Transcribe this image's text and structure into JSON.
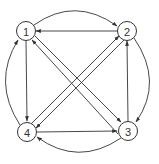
{
  "diagram": {
    "type": "directed-graph",
    "nodes": [
      {
        "id": "1",
        "label": "1",
        "x": 26,
        "y": 31
      },
      {
        "id": "2",
        "label": "2",
        "x": 127,
        "y": 31
      },
      {
        "id": "3",
        "label": "3",
        "x": 128,
        "y": 131
      },
      {
        "id": "4",
        "label": "4",
        "x": 27,
        "y": 132
      }
    ],
    "edges": [
      {
        "from": "1",
        "to": "2",
        "style": "arc-outer"
      },
      {
        "from": "2",
        "to": "3",
        "style": "arc-outer"
      },
      {
        "from": "3",
        "to": "4",
        "style": "arc-outer"
      },
      {
        "from": "4",
        "to": "1",
        "style": "arc-outer"
      },
      {
        "from": "2",
        "to": "1",
        "style": "straight"
      },
      {
        "from": "1",
        "to": "4",
        "style": "straight"
      },
      {
        "from": "4",
        "to": "3",
        "style": "straight"
      },
      {
        "from": "3",
        "to": "2",
        "style": "straight"
      },
      {
        "from": "1",
        "to": "3",
        "style": "diagonal"
      },
      {
        "from": "3",
        "to": "1",
        "style": "diagonal"
      },
      {
        "from": "4",
        "to": "2",
        "style": "diagonal"
      },
      {
        "from": "2",
        "to": "4",
        "style": "diagonal"
      }
    ],
    "colors": {
      "stroke": "#333333",
      "background": "#ffffff"
    }
  }
}
